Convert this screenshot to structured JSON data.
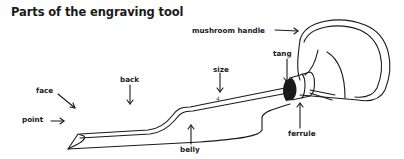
{
  "title": "Parts of the engraving tool",
  "labels": {
    "mushroom_handle": "mushroom handle",
    "tang": "tang",
    "back": "back",
    "size": "size",
    "face": "face",
    "point": "point",
    "belly": "belly",
    "ferrule": "ferrule",
    "size_mark": "4"
  },
  "colors": {
    "ink": "#1a1a1a",
    "background": "#ffffff"
  }
}
